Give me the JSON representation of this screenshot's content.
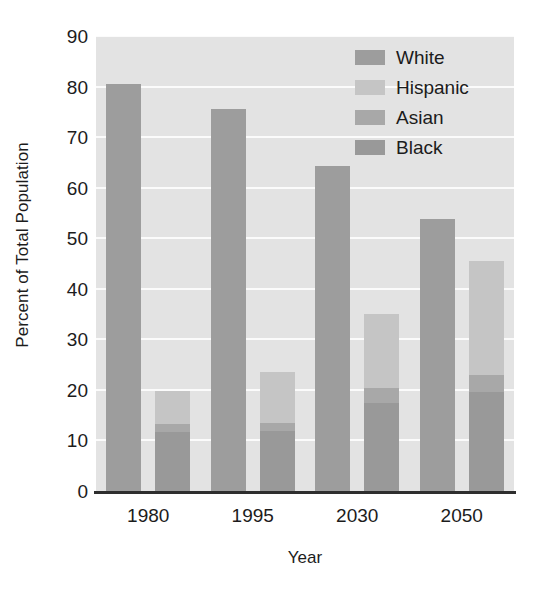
{
  "chart_data": {
    "type": "bar",
    "title": "",
    "xlabel": "Year",
    "ylabel": "Percent of Total Population",
    "categories": [
      "1980",
      "1995",
      "2030",
      "2050"
    ],
    "ylim": [
      0,
      90
    ],
    "yticks": [
      0,
      10,
      20,
      30,
      40,
      50,
      60,
      70,
      80,
      90
    ],
    "grid": true,
    "legend_position": "upper-right",
    "legend": [
      "White",
      "Hispanic",
      "Asian",
      "Black"
    ],
    "series": [
      {
        "name": "White",
        "values": [
          80.5,
          75.5,
          64.2,
          53.8
        ]
      },
      {
        "name": "Hispanic",
        "values": [
          6.4,
          10.2,
          14.8,
          22.5
        ]
      },
      {
        "name": "Asian",
        "values": [
          1.6,
          1.5,
          2.8,
          3.4
        ]
      },
      {
        "name": "Black",
        "values": [
          11.7,
          11.9,
          17.5,
          19.6
        ]
      }
    ],
    "minority_bar_totals": [
      20.4,
      23.5,
      35.1,
      45.5
    ],
    "colors": {
      "white": "#9d9d9d",
      "hispanic": "#c5c5c5",
      "asian": "#a8a8a8",
      "black": "#999999",
      "plot_background": "#e3e3e3",
      "gridline": "#fbfbfb",
      "axis": "#2e2e2e",
      "text": "#1c1c1c"
    }
  }
}
